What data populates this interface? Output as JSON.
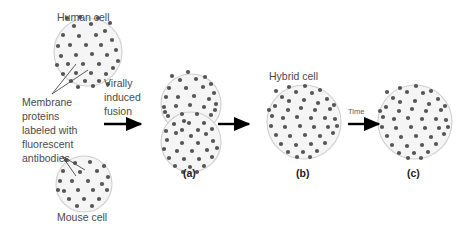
{
  "figure": {
    "title_alt": "Frye-Edidin cell fusion membrane fluidity experiment",
    "background_color": "#ffffff",
    "cell_fill": "#f5f5f5",
    "cell_stroke": "#cfcfcf",
    "dot_color": "#555555",
    "text_color": "#4a4a4a",
    "arrow_color": "#000000"
  },
  "labels": {
    "human_cell": "Human cell",
    "mouse_cell": "Mouse cell",
    "hybrid_cell": "Hybrid cell",
    "membrane_proteins": "Membrane\nproteins\nlabeled with\nfluorescent\nantibodies",
    "virally_induced_fusion": "Virally\ninduced\nfusion",
    "time": "Time"
  },
  "panels": [
    {
      "id": "a",
      "label": "(a)",
      "description": "fused doublet, proteins still segregated"
    },
    {
      "id": "b",
      "label": "(b)",
      "description": "hybrid cell, proteins partially intermixed"
    },
    {
      "id": "c",
      "label": "(c)",
      "description": "hybrid cell, proteins fully intermixed"
    }
  ],
  "cells": {
    "human": {
      "cx": 88,
      "cy": 52,
      "r": 34,
      "dots": 36
    },
    "mouse": {
      "cx": 84,
      "cy": 184,
      "r": 28,
      "dots": 22
    },
    "fused_top": {
      "cx": 191,
      "cy": 104,
      "r": 30,
      "dots": 30
    },
    "fused_bottom": {
      "cx": 191,
      "cy": 142,
      "r": 30,
      "dots": 26
    },
    "hybrid_b": {
      "cx": 304,
      "cy": 122,
      "r": 37,
      "dots": 44
    },
    "hybrid_c": {
      "cx": 415,
      "cy": 122,
      "r": 37,
      "dots": 44
    }
  },
  "arrows": [
    {
      "name": "fusion-arrow",
      "x1": 104,
      "y1": 124,
      "x2": 144,
      "y2": 124
    },
    {
      "name": "ab-arrow",
      "x1": 218,
      "y1": 124,
      "x2": 252,
      "y2": 124
    },
    {
      "name": "time-arrow",
      "x1": 348,
      "y1": 124,
      "x2": 382,
      "y2": 124
    }
  ]
}
